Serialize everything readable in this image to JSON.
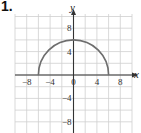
{
  "problem_number": "1.",
  "chart_data": {
    "type": "line",
    "title": "",
    "xlabel": "x",
    "ylabel": "y",
    "xlim": [
      -10,
      10
    ],
    "ylim": [
      -10,
      10
    ],
    "grid": true,
    "grid_step": 2,
    "x_ticks": [
      "-8",
      "-4",
      "0",
      "4",
      "8"
    ],
    "y_ticks": [
      "8",
      "4",
      "-4",
      "-8"
    ],
    "series": [
      {
        "name": "semicircle y = sqrt(36 - x^2)",
        "description": "Upper half of circle centered at origin, radius 6",
        "x": [
          -6,
          -5,
          -4,
          -3,
          -2,
          -1,
          0,
          1,
          2,
          3,
          4,
          5,
          6
        ],
        "y": [
          0,
          3.32,
          4.47,
          5.2,
          5.66,
          5.92,
          6,
          5.92,
          5.66,
          5.2,
          4.47,
          3.32,
          0
        ]
      }
    ],
    "colors": {
      "curve": "#6e6e6e",
      "grid": "#cfcfcf",
      "axis": "#333333"
    }
  }
}
